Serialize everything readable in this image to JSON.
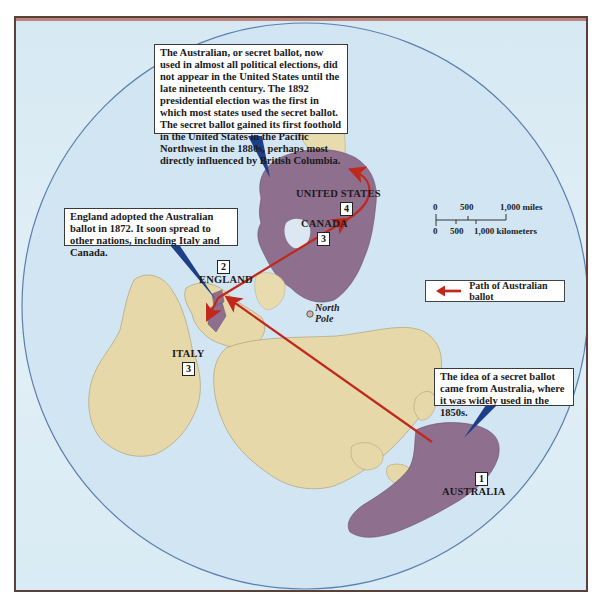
{
  "map": {
    "title": "Path of the Australian (secret) ballot",
    "projection": "polar azimuthal",
    "colors": {
      "ocean": "#d4e6f4",
      "land": "#e6d8a8",
      "highlighted_land": "#8e6f8e",
      "path_arrow": "#c0281c",
      "callout_pointer": "#1d3f8a",
      "frame_border": "#5a4038"
    }
  },
  "callouts": {
    "united_states": "The Australian, or secret ballot, now used in almost all political elections, did not appear in the United States until the late nineteenth century. The 1892 presidential election was the first in which most states used the secret ballot. The secret ballot gained its first foothold in the United States in the Pacific Northwest in the 1880s, perhaps most directly influenced by British Columbia.",
    "england": "England adopted the Australian ballot in 1872. It soon spread to other nations, including Italy and Canada.",
    "australia": "The idea of a secret ballot came from Australia, where it was widely used in the 1850s."
  },
  "places": [
    {
      "name": "AUSTRALIA",
      "step": "1"
    },
    {
      "name": "ENGLAND",
      "step": "2"
    },
    {
      "name": "ITALY",
      "step": "3"
    },
    {
      "name": "CANADA",
      "step": "3"
    },
    {
      "name": "UNITED STATES",
      "step": "4"
    }
  ],
  "north_pole": {
    "line1": "North",
    "line2": "Pole"
  },
  "legend": {
    "label": "Path of Australian ballot",
    "icon": "red-arrow-left"
  },
  "scale": {
    "miles": [
      "0",
      "500",
      "1,000 miles"
    ],
    "kilometers": [
      "0",
      "500",
      "1,000 kilometers"
    ]
  }
}
